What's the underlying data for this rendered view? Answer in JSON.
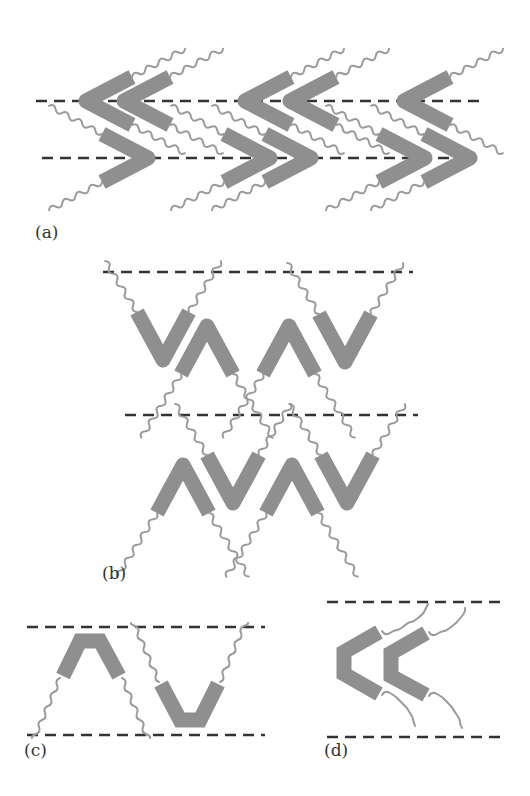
{
  "figure": {
    "colors": {
      "core": "#8f8f8f",
      "tail": "#9a9a9a",
      "layer_line": "#333333",
      "label": "#333333",
      "background": "#ffffff"
    }
  },
  "panels": [
    {
      "id": "a",
      "label": "(a)",
      "content": "Interdigitated chevrons (< and >) between two dashed layer lines"
    },
    {
      "id": "b",
      "label": "(b)",
      "content": "Two stacked layers of alternating V and Λ bent molecules"
    },
    {
      "id": "c",
      "label": "(c)",
      "content": "One Λ and one V molecule spanning a single layer"
    },
    {
      "id": "d",
      "label": "(d)",
      "content": "Two < molecules in a single layer"
    }
  ]
}
